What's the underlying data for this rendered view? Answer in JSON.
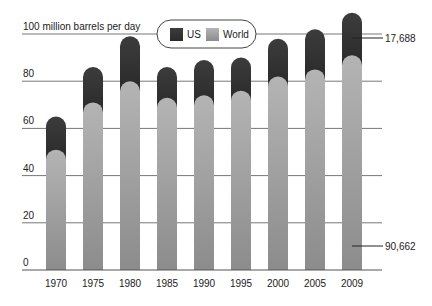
{
  "chart_data": {
    "type": "bar",
    "stacked": true,
    "title": "",
    "unit_label": "100 million barrels per day",
    "xlabel": "",
    "ylabel": "100 million barrels per day",
    "ylim": [
      0,
      100
    ],
    "yticks": [
      0,
      20,
      40,
      60,
      80
    ],
    "grid": true,
    "legend_position": "top-center",
    "categories": [
      "1970",
      "1975",
      "1980",
      "1985",
      "1990",
      "1995",
      "2000",
      "2005",
      "2009"
    ],
    "series": [
      {
        "name": "World",
        "color": "#9a9a9a",
        "values": [
          51,
          71,
          80,
          73,
          74,
          76,
          82,
          85,
          91
        ]
      },
      {
        "name": "US",
        "color": "#333333",
        "values": [
          14,
          15,
          19,
          13,
          15,
          14,
          16,
          17,
          18
        ]
      }
    ],
    "totals": [
      65,
      86,
      99,
      86,
      89,
      90,
      98,
      102,
      109
    ],
    "annotations": [
      {
        "label": "17,688",
        "target": "US 2009"
      },
      {
        "label": "90,662",
        "target": "World 2009"
      }
    ]
  },
  "legend": {
    "items": [
      {
        "label": "US",
        "color": "#333333"
      },
      {
        "label": "World",
        "color": "#9a9a9a"
      }
    ]
  }
}
